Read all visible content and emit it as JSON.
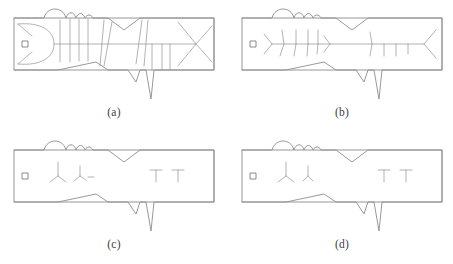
{
  "figure": {
    "background_color": "#ffffff",
    "stroke_color": "#8d8d8d",
    "caption_color": "#3d3d3d",
    "panel_count": 4,
    "panels": [
      {
        "id": "a",
        "caption": "(a)",
        "description": "fish contour with full internal skeleton and cross ribs inside bounding box",
        "marker": "small-square",
        "interior_detail": "full"
      },
      {
        "id": "b",
        "caption": "(b)",
        "description": "fish bounding box with pruned skeleton spine and short rib branches",
        "marker": "small-square",
        "interior_detail": "skeleton"
      },
      {
        "id": "c",
        "caption": "(c)",
        "description": "fish bounding box with only a few residual Y shaped branch fragments",
        "marker": "small-square",
        "interior_detail": "fragments"
      },
      {
        "id": "d",
        "caption": "(d)",
        "description": "fish bounding box with the fewest residual Y shaped branch fragments",
        "marker": "small-square",
        "interior_detail": "fragments-reduced"
      }
    ]
  }
}
